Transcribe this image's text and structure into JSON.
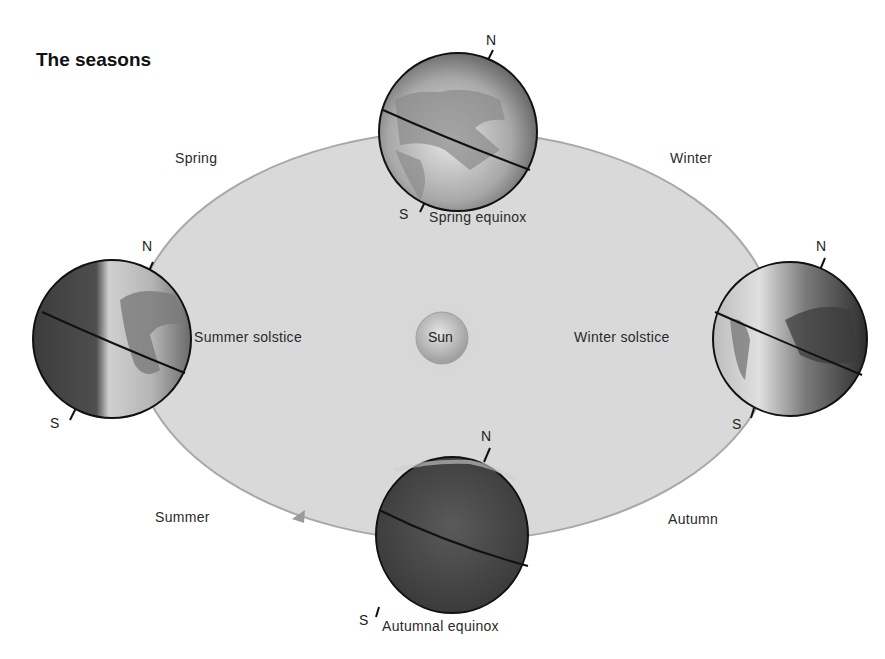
{
  "title": "The seasons",
  "sun": {
    "label": "Sun"
  },
  "seasons": {
    "spring": "Spring",
    "winter": "Winter",
    "summer": "Summer",
    "autumn": "Autumn"
  },
  "positions": {
    "spring_equinox": {
      "label": "Spring equinox",
      "north": "N",
      "south": "S"
    },
    "summer_solstice": {
      "label": "Summer solstice",
      "north": "N",
      "south": "S"
    },
    "winter_solstice": {
      "label": "Winter solstice",
      "north": "N",
      "south": "S"
    },
    "autumnal_equinox": {
      "label": "Autumnal equinox",
      "north": "N",
      "south": "S"
    }
  },
  "colors": {
    "orbit_fill": "#d9d9d9",
    "orbit_edge": "#a8a8a8",
    "globe_dark": "#3a3a3a",
    "globe_light": "#d0d0d0",
    "sun_fill": "#bdbdbd"
  }
}
